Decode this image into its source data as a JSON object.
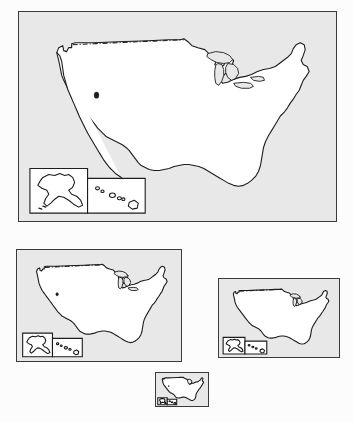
{
  "figure": {
    "background_color": "#fcfcfc",
    "panel_fill": "#e8e8e8",
    "panel_border_color": "#3a3a3a",
    "land_fill": "#ffffff",
    "outline_color": "#1c1c1c"
  },
  "panels": [
    {
      "id": "panel-large",
      "name": "United States map, largest scale",
      "scale_label": "100%",
      "x": 18,
      "y": 11,
      "width": 319,
      "height": 211,
      "has_alaska_inset": true,
      "has_hawaii_inset": true,
      "has_canada_border": true,
      "has_marker_dot": true
    },
    {
      "id": "panel-medium",
      "name": "United States map, medium scale",
      "scale_label": "52%",
      "x": 16,
      "y": 249,
      "width": 166,
      "height": 113,
      "has_alaska_inset": true,
      "has_hawaii_inset": true,
      "has_canada_border": true,
      "has_marker_dot": true
    },
    {
      "id": "panel-small",
      "name": "United States map, small scale",
      "scale_label": "38%",
      "x": 218,
      "y": 278,
      "width": 122,
      "height": 80,
      "has_alaska_inset": true,
      "has_hawaii_inset": true,
      "has_canada_border": true,
      "has_marker_dot": false
    },
    {
      "id": "panel-tiny",
      "name": "United States map, smallest scale",
      "scale_label": "17%",
      "x": 155,
      "y": 372,
      "width": 54,
      "height": 35,
      "has_alaska_inset": true,
      "has_hawaii_inset": true,
      "has_canada_border": false,
      "has_marker_dot": true
    }
  ],
  "insets": {
    "alaska_label": "Alaska inset",
    "hawaii_label": "Hawaii inset"
  },
  "map_features": {
    "canada_border_label": "United States - Canada border",
    "great_lakes_label": "Great Lakes",
    "marker_label": "interior lake marker"
  },
  "caption": {
    "text": "clipped caption line",
    "visible": false
  }
}
